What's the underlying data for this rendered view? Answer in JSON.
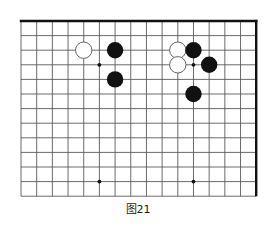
{
  "figure": {
    "caption": "图21",
    "kind": "go-board-diagram"
  },
  "board": {
    "origin_x": 21,
    "origin_y": 21,
    "col_spacing": 15.68,
    "row_spacing": 14.6,
    "cols": 16,
    "rows": 13,
    "line_color": "#5a5a5a",
    "edge_color": "#111111",
    "edge_width": 2.4,
    "line_width": 0.9,
    "background": "#ffffff",
    "top_edge_row": 0,
    "right_edge_col": 15
  },
  "star_points": [
    {
      "col": 5,
      "row": 3,
      "label": "upper-left-star"
    },
    {
      "col": 11,
      "row": 3,
      "label": "upper-right-star"
    },
    {
      "col": 5,
      "row": 11,
      "label": "lower-left-star"
    },
    {
      "col": 11,
      "row": 11,
      "label": "lower-right-star"
    }
  ],
  "stones": [
    {
      "id": 1,
      "color": "white",
      "col": 4,
      "row": 2,
      "label": "white-stone-left-upper"
    },
    {
      "id": 2,
      "color": "black",
      "col": 6,
      "row": 2,
      "label": "black-stone-left-upper"
    },
    {
      "id": 3,
      "color": "black",
      "col": 6,
      "row": 4,
      "label": "black-stone-left-lower"
    },
    {
      "id": 4,
      "color": "white",
      "col": 10,
      "row": 2,
      "label": "white-stone-right-upper"
    },
    {
      "id": 5,
      "color": "white",
      "col": 10,
      "row": 3,
      "label": "white-stone-right-lower"
    },
    {
      "id": 6,
      "color": "black",
      "col": 11,
      "row": 2,
      "label": "black-stone-right-top"
    },
    {
      "id": 7,
      "color": "black",
      "col": 12,
      "row": 3,
      "label": "black-stone-right-side"
    },
    {
      "id": 8,
      "color": "black",
      "col": 11,
      "row": 5,
      "label": "black-stone-right-below"
    }
  ],
  "stone_style": {
    "radius": 8.2,
    "black_fill": "#111111",
    "white_fill": "#ffffff",
    "white_stroke": "#555555",
    "white_stroke_width": 0.9
  }
}
